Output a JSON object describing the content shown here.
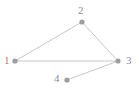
{
  "figure": {
    "type": "node-link-graph",
    "width": 139,
    "height": 94,
    "background_color": "#ffffff",
    "edge_color": "#c8c8c8",
    "edge_width": 1,
    "node_color": "#9e9e9e",
    "node_radius": 2.6,
    "label_color": "#8c8c8c"
  },
  "nodes": [
    {
      "id": "1",
      "label": "1",
      "x": 15,
      "y": 61,
      "label_x": 4,
      "label_y": 55
    },
    {
      "id": "2",
      "label": "2",
      "x": 82,
      "y": 22,
      "label_x": 78,
      "label_y": 5
    },
    {
      "id": "3",
      "label": "3",
      "x": 118,
      "y": 61,
      "label_x": 126,
      "label_y": 55
    },
    {
      "id": "4",
      "label": "4",
      "x": 67,
      "y": 80,
      "label_x": 54,
      "label_y": 73
    }
  ],
  "edges": [
    {
      "id": "edge-1-2",
      "source": "1",
      "target": "2",
      "x1": 15,
      "y1": 61,
      "x2": 82,
      "y2": 22
    },
    {
      "id": "edge-2-3",
      "source": "2",
      "target": "3",
      "x1": 82,
      "y1": 22,
      "x2": 118,
      "y2": 61
    },
    {
      "id": "edge-1-3",
      "source": "1",
      "target": "3",
      "x1": 15,
      "y1": 61,
      "x2": 118,
      "y2": 61
    },
    {
      "id": "edge-4-3",
      "source": "4",
      "target": "3",
      "x1": 67,
      "y1": 80,
      "x2": 118,
      "y2": 61
    }
  ]
}
